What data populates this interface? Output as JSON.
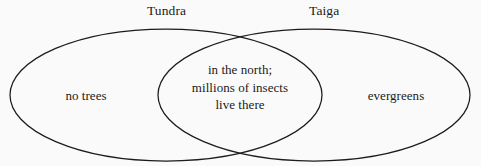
{
  "diagram": {
    "type": "venn-2-set",
    "background_color": "#fafafa",
    "stroke_color": "#1c1c1c",
    "text_color": "#1a1a1a",
    "sets": [
      {
        "key": "left",
        "label": "Tundra",
        "unique_text": "no trees",
        "ellipse": {
          "cx": 166,
          "cy": 95,
          "rx": 156,
          "ry": 66
        }
      },
      {
        "key": "right",
        "label": "Taiga",
        "unique_text": "evergreens",
        "ellipse": {
          "cx": 314,
          "cy": 95,
          "rx": 156,
          "ry": 66
        }
      }
    ],
    "intersection": {
      "lines": [
        "in the north;",
        "millions of insects",
        "live there"
      ]
    }
  }
}
